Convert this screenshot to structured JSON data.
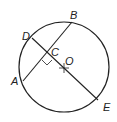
{
  "diagram": {
    "type": "circle-geometry",
    "circle": {
      "cx": 64,
      "cy": 67,
      "r": 45,
      "center_label": "O"
    },
    "points": {
      "A": {
        "label": "A",
        "x": 23,
        "y": 81
      },
      "B": {
        "label": "B",
        "x": 72,
        "y": 22
      },
      "C": {
        "label": "C",
        "x": 48,
        "y": 53
      },
      "D": {
        "label": "D",
        "x": 32,
        "y": 38
      },
      "E": {
        "label": "E",
        "x": 98,
        "y": 100
      },
      "O": {
        "label": "O",
        "x": 64,
        "y": 68
      }
    },
    "segments": [
      {
        "name": "chord-AB",
        "from": "A",
        "to": "B"
      },
      {
        "name": "diameter-DE",
        "from": "D",
        "to": "E"
      }
    ],
    "right_angle_at": "C",
    "stroke_color": "#222222"
  }
}
